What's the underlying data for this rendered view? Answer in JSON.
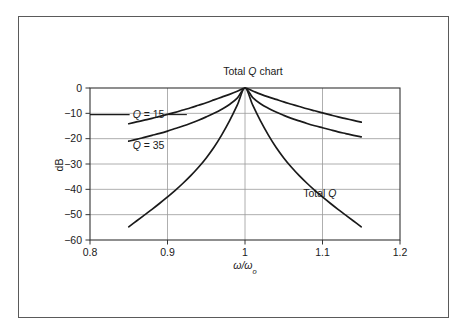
{
  "figure": {
    "border_color": "#5a5a5a",
    "background": "#ffffff"
  },
  "chart_data": {
    "type": "line",
    "title": "Total Q chart",
    "title_parts": {
      "pre": "Total ",
      "italic": "Q",
      "post": " chart"
    },
    "xlabel": "ω/ωo",
    "xlabel_parts": {
      "main": "ω/ω",
      "subscript": "o"
    },
    "ylabel": "dB",
    "xlim": [
      0.8,
      1.2
    ],
    "ylim": [
      -60,
      0
    ],
    "xticks": [
      "0.8",
      "0.9",
      "1",
      "1.1",
      "1.2"
    ],
    "xtick_values": [
      0.8,
      0.9,
      1.0,
      1.1,
      1.2
    ],
    "yticks": [
      "0",
      "−10",
      "−20",
      "−30",
      "−40",
      "−50",
      "−60"
    ],
    "ytick_values": [
      0,
      -10,
      -20,
      -30,
      -40,
      -50,
      -60
    ],
    "grid": true,
    "grid_color": "#9a9a9a",
    "axis_color": "#333333",
    "line_color": "#1a1a1a",
    "legend_position": "inline-annotations",
    "series": [
      {
        "name": "Q = 15",
        "label_parts": {
          "italic": "Q",
          "post": " = 15"
        },
        "q": 15,
        "x": [
          0.85,
          0.86,
          0.87,
          0.88,
          0.89,
          0.9,
          0.91,
          0.92,
          0.93,
          0.94,
          0.95,
          0.96,
          0.97,
          0.98,
          0.99,
          1.0,
          1.01,
          1.02,
          1.03,
          1.04,
          1.05,
          1.06,
          1.07,
          1.08,
          1.09,
          1.1,
          1.11,
          1.12,
          1.13,
          1.14,
          1.15
        ],
        "values": [
          -14.1,
          -13.4,
          -12.7,
          -12.0,
          -11.2,
          -10.4,
          -9.6,
          -8.7,
          -7.8,
          -6.8,
          -5.8,
          -4.7,
          -3.6,
          -2.5,
          -1.3,
          0.0,
          -1.2,
          -2.4,
          -3.5,
          -4.5,
          -5.5,
          -6.4,
          -7.3,
          -8.2,
          -9.0,
          -9.8,
          -10.6,
          -11.4,
          -12.1,
          -12.8,
          -13.5
        ]
      },
      {
        "name": "Q = 35",
        "label_parts": {
          "italic": "Q",
          "post": " = 35"
        },
        "q": 35,
        "x": [
          0.85,
          0.86,
          0.87,
          0.88,
          0.89,
          0.9,
          0.91,
          0.92,
          0.93,
          0.94,
          0.95,
          0.96,
          0.97,
          0.98,
          0.99,
          1.0,
          1.01,
          1.02,
          1.03,
          1.04,
          1.05,
          1.06,
          1.07,
          1.08,
          1.09,
          1.1,
          1.11,
          1.12,
          1.13,
          1.14,
          1.15
        ],
        "values": [
          -21.0,
          -20.3,
          -19.5,
          -18.7,
          -17.9,
          -17.0,
          -16.0,
          -15.0,
          -13.9,
          -12.7,
          -11.4,
          -10.0,
          -8.4,
          -6.5,
          -4.0,
          0.0,
          -3.8,
          -6.2,
          -8.0,
          -9.5,
          -10.8,
          -12.0,
          -13.0,
          -14.0,
          -14.9,
          -15.7,
          -16.5,
          -17.3,
          -18.0,
          -18.7,
          -19.3
        ]
      },
      {
        "name": "Total Q",
        "label_parts": {
          "pre": "Total ",
          "italic": "Q"
        },
        "x": [
          0.85,
          0.86,
          0.87,
          0.88,
          0.89,
          0.9,
          0.91,
          0.92,
          0.93,
          0.94,
          0.95,
          0.96,
          0.97,
          0.98,
          0.99,
          1.0,
          1.01,
          1.02,
          1.03,
          1.04,
          1.05,
          1.06,
          1.07,
          1.08,
          1.09,
          1.1,
          1.11,
          1.12,
          1.13,
          1.14,
          1.15
        ],
        "values": [
          -54.8,
          -52.5,
          -50.2,
          -47.9,
          -45.5,
          -43.0,
          -40.4,
          -37.6,
          -34.6,
          -31.3,
          -27.6,
          -23.4,
          -18.5,
          -13.0,
          -6.8,
          0.0,
          -6.8,
          -13.0,
          -18.5,
          -23.4,
          -27.6,
          -31.3,
          -34.6,
          -37.6,
          -40.4,
          -43.0,
          -45.5,
          -47.9,
          -50.2,
          -52.5,
          -54.8
        ]
      }
    ],
    "annotations": [
      {
        "name": "q15-label",
        "text": "Q = 15",
        "x": 0.855,
        "y": -10.5
      },
      {
        "name": "q35-label",
        "text": "Q = 35",
        "x": 0.855,
        "y": -22.5
      },
      {
        "name": "totalq-label",
        "text": "Total Q",
        "x": 1.075,
        "y": -41.5
      }
    ]
  }
}
